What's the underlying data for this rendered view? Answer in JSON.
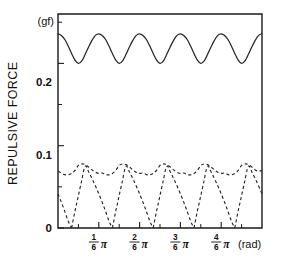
{
  "figure": {
    "y_axis_title": "REPULSIVE FORCE",
    "y_unit_label": "(gf)",
    "x_unit_label": "(rad)",
    "y_tick_labels": [
      "0",
      "0.1",
      "0.2"
    ],
    "x_tick_labels": [
      "1/6 π",
      "2/6 π",
      "3/6 π",
      "4/6 π"
    ],
    "x_tick_numerators": [
      "1",
      "2",
      "3",
      "4"
    ],
    "x_tick_denominators": [
      "6",
      "6",
      "6",
      "6"
    ],
    "pi_symbol": "π",
    "colors": {
      "ink": "#1a1a1a",
      "curve": "#262626",
      "background": "#ffffff"
    }
  },
  "chart_data": {
    "type": "line",
    "title": "",
    "xlabel": "(rad)",
    "ylabel": "REPULSIVE FORCE",
    "yunit": "gf",
    "xlim": [
      0,
      0.83333
    ],
    "ylim": [
      0,
      0.26
    ],
    "xlim_pi_units": [
      0,
      0.83333
    ],
    "ytick_values": [
      0,
      0.1,
      0.2
    ],
    "ytick_minor_values": [
      0.05,
      0.15,
      0.25
    ],
    "xtick_values_pi": [
      0.16667,
      0.33333,
      0.5,
      0.66667
    ],
    "xtick_minor_values_pi": [
      0.08333,
      0.25,
      0.41667,
      0.58333,
      0.75
    ],
    "grid": false,
    "legend": false,
    "series": [
      {
        "name": "total repulsive force",
        "style": "solid",
        "description": "Oscillating total force between 0.200 and 0.236 gf with period pi/6 rad; six peaks across the plot.",
        "baseline": 0.2,
        "amplitude": 0.036,
        "period_pi": 0.16667,
        "phase_pi": 0.0,
        "x_pi": [
          0.0,
          0.0139,
          0.0278,
          0.0417,
          0.0556,
          0.0694,
          0.0833,
          0.0972,
          0.1111,
          0.125,
          0.1389,
          0.1528,
          0.1667,
          0.1806,
          0.1944,
          0.2083,
          0.2222,
          0.2361,
          0.25,
          0.2639,
          0.2778,
          0.2917,
          0.3056,
          0.3194,
          0.3333,
          0.3472,
          0.3611,
          0.375,
          0.3889,
          0.4028,
          0.4167,
          0.4306,
          0.4444,
          0.4583,
          0.4722,
          0.4861,
          0.5,
          0.5139,
          0.5278,
          0.5417,
          0.5556,
          0.5694,
          0.5833,
          0.5972,
          0.6111,
          0.625,
          0.6389,
          0.6528,
          0.6667,
          0.6806,
          0.6944,
          0.7083,
          0.7222,
          0.7361,
          0.75,
          0.7639,
          0.7778,
          0.7917,
          0.8056,
          0.8194,
          0.8333
        ],
        "y": [
          0.236,
          0.234,
          0.229,
          0.221,
          0.212,
          0.204,
          0.2,
          0.203,
          0.211,
          0.22,
          0.228,
          0.234,
          0.236,
          0.234,
          0.229,
          0.221,
          0.212,
          0.204,
          0.2,
          0.203,
          0.211,
          0.22,
          0.228,
          0.234,
          0.236,
          0.234,
          0.229,
          0.221,
          0.212,
          0.204,
          0.2,
          0.203,
          0.211,
          0.22,
          0.228,
          0.234,
          0.236,
          0.234,
          0.229,
          0.221,
          0.212,
          0.204,
          0.2,
          0.203,
          0.211,
          0.22,
          0.228,
          0.234,
          0.236,
          0.234,
          0.229,
          0.221,
          0.212,
          0.204,
          0.2,
          0.203,
          0.211,
          0.22,
          0.228,
          0.234,
          0.236
        ]
      },
      {
        "name": "envelope of individual contributions",
        "style": "dashed",
        "description": "Rippling dashed envelope near 0.07 gf, oscillating between about 0.063 and 0.078 gf with period pi/12 rad.",
        "baseline": 0.0705,
        "amplitude": 0.0075,
        "period_pi": 0.08333,
        "x_pi": [
          0.0,
          0.0139,
          0.0278,
          0.0417,
          0.0556,
          0.0694,
          0.0833,
          0.0972,
          0.1111,
          0.125,
          0.1389,
          0.1528,
          0.1667,
          0.1806,
          0.1944,
          0.2083,
          0.2222,
          0.2361,
          0.25,
          0.2639,
          0.2778,
          0.2917,
          0.3056,
          0.3194,
          0.3333,
          0.3472,
          0.3611,
          0.375,
          0.3889,
          0.4028,
          0.4167,
          0.4306,
          0.4444,
          0.4583,
          0.4722,
          0.4861,
          0.5,
          0.5139,
          0.5278,
          0.5417,
          0.5556,
          0.5694,
          0.5833,
          0.5972,
          0.6111,
          0.625,
          0.6389,
          0.6528,
          0.6667,
          0.6806,
          0.6944,
          0.7083,
          0.7222,
          0.7361,
          0.75,
          0.7639,
          0.7778,
          0.7917,
          0.8056,
          0.8194,
          0.8333
        ],
        "y": [
          0.069,
          0.0668,
          0.0648,
          0.0646,
          0.0663,
          0.07,
          0.076,
          0.0778,
          0.077,
          0.0742,
          0.0706,
          0.0678,
          0.0663,
          0.0668,
          0.0648,
          0.0646,
          0.0663,
          0.07,
          0.076,
          0.0778,
          0.077,
          0.0742,
          0.0706,
          0.0678,
          0.0663,
          0.0668,
          0.0648,
          0.0646,
          0.0663,
          0.07,
          0.076,
          0.0778,
          0.077,
          0.0742,
          0.0706,
          0.0678,
          0.0663,
          0.0668,
          0.0648,
          0.0646,
          0.0663,
          0.07,
          0.076,
          0.0778,
          0.077,
          0.0742,
          0.0706,
          0.0678,
          0.0663,
          0.0668,
          0.0648,
          0.0646,
          0.0663,
          0.07,
          0.076,
          0.0778,
          0.077,
          0.0742,
          0.0706,
          0.069,
          0.07
        ]
      },
      {
        "name": "individual tooth contributions",
        "style": "dashed",
        "description": "Six repeated dashed arcs. Each rises steeply from 0 gf, peaks at about 0.075 gf, then decays gradually back to 0 gf over one pi/6 rad period. Successive arcs are offset by pi/6 rad.",
        "arc_period_pi": 0.16667,
        "arc_peak_value": 0.075,
        "arc_rise_fraction": 0.33,
        "arc_offsets_pi": [
          -0.1111,
          0.0556,
          0.2222,
          0.3889,
          0.5556,
          0.7222
        ],
        "arc_shape_x_frac": [
          0.0,
          0.08,
          0.16,
          0.24,
          0.33,
          0.42,
          0.52,
          0.62,
          0.72,
          0.82,
          0.92,
          1.0
        ],
        "arc_shape_y": [
          0.0,
          0.02,
          0.038,
          0.056,
          0.075,
          0.068,
          0.058,
          0.047,
          0.035,
          0.022,
          0.008,
          0.0
        ]
      }
    ]
  }
}
